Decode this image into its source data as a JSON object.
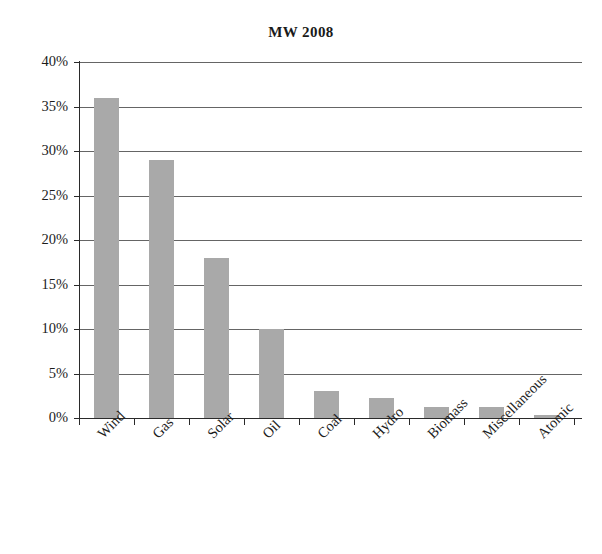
{
  "chart_data": {
    "type": "bar",
    "title": "MW 2008",
    "subtitle": "",
    "xlabel": "",
    "ylabel": "",
    "categories": [
      "Wind",
      "Gas",
      "Solar",
      "Oil",
      "Coal",
      "Hydro",
      "Biomass",
      "Miscellaneous",
      "Atomic"
    ],
    "values": [
      36,
      29,
      18,
      10,
      3,
      2.2,
      1.2,
      1.2,
      0.3
    ],
    "value_unit": "%",
    "ylim": [
      0,
      40
    ],
    "ytick_step": 5,
    "ytick_labels": [
      "40%",
      "35%",
      "30%",
      "25%",
      "20%",
      "15%",
      "10%",
      "5%",
      "0%"
    ],
    "ytick_values": [
      40,
      35,
      30,
      25,
      20,
      15,
      10,
      5,
      0
    ],
    "grid": "horizontal",
    "legend": "none",
    "bar_color": "#a9a9a9",
    "axis_color": "#2a2a2a",
    "gridline_color": "#4a4a4a",
    "text_color": "#1c1c1c",
    "xlabel_rotation_degrees": 45
  }
}
